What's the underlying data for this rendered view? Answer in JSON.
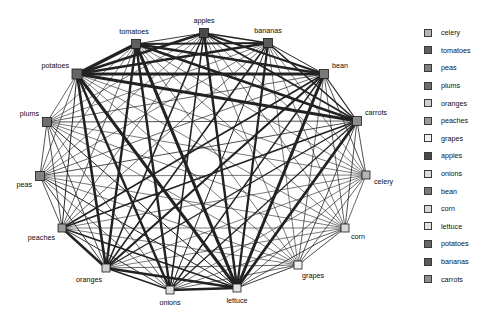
{
  "figure": {
    "type": "network-graph",
    "layout": "circular",
    "background_color": "#ffffff",
    "node_shape": "square",
    "node_outline_color": "#1a1a1a",
    "edge_color": "#222222",
    "label_color": "#0a0a0a"
  },
  "graph": {
    "nodes": [
      {
        "id": "apples",
        "label": "apples",
        "x": 204,
        "y": 33,
        "size": 9,
        "color": "#4a4a4a",
        "label_dx": 0,
        "label_dy": -10,
        "label_anchor": "middle"
      },
      {
        "id": "bananas",
        "label": "bananas",
        "x": 268,
        "y": 43,
        "size": 9,
        "color": "#5a5a5a",
        "label_dx": 0,
        "label_dy": -10,
        "label_anchor": "middle"
      },
      {
        "id": "bean",
        "label": "bean",
        "x": 324,
        "y": 74,
        "size": 9,
        "color": "#7a7a7a",
        "label_dx": 8,
        "label_dy": -6,
        "label_anchor": "start"
      },
      {
        "id": "carrots",
        "label": "carrots",
        "x": 357,
        "y": 121,
        "size": 9,
        "color": "#8d8d8d",
        "label_dx": 8,
        "label_dy": -6,
        "label_anchor": "start"
      },
      {
        "id": "celery",
        "label": "celery",
        "x": 366,
        "y": 175,
        "size": 8,
        "color": "#b5b5b5",
        "label_dx": 8,
        "label_dy": 9,
        "label_anchor": "start"
      },
      {
        "id": "corn",
        "label": "corn",
        "x": 345,
        "y": 228,
        "size": 8,
        "color": "#d8d8d8",
        "label_dx": 6,
        "label_dy": 11,
        "label_anchor": "start"
      },
      {
        "id": "grapes",
        "label": "grapes",
        "x": 298,
        "y": 265,
        "size": 8,
        "color": "#f0f0f0",
        "label_dx": 4,
        "label_dy": 13,
        "label_anchor": "start"
      },
      {
        "id": "lettuce",
        "label": "lettuce",
        "x": 237,
        "y": 288,
        "size": 8,
        "color": "#e2e2e2",
        "label_dx": 0,
        "label_dy": 15,
        "label_anchor": "middle"
      },
      {
        "id": "onions",
        "label": "onions",
        "x": 170,
        "y": 290,
        "size": 8,
        "color": "#dcdcdc",
        "label_dx": 0,
        "label_dy": 15,
        "label_anchor": "middle"
      },
      {
        "id": "oranges",
        "label": "oranges",
        "x": 106,
        "y": 268,
        "size": 8,
        "color": "#cfcfcf",
        "label_dx": -4,
        "label_dy": 14,
        "label_anchor": "end"
      },
      {
        "id": "peaches",
        "label": "peaches",
        "x": 62,
        "y": 228,
        "size": 8,
        "color": "#9a9a9a",
        "label_dx": -7,
        "label_dy": 12,
        "label_anchor": "end"
      },
      {
        "id": "peas",
        "label": "peas",
        "x": 40,
        "y": 176,
        "size": 9,
        "color": "#808080",
        "label_dx": -8,
        "label_dy": 11,
        "label_anchor": "end"
      },
      {
        "id": "plums",
        "label": "plums",
        "x": 47,
        "y": 122,
        "size": 9,
        "color": "#6e6e6e",
        "label_dx": -8,
        "label_dy": -6,
        "label_anchor": "end"
      },
      {
        "id": "potatoes",
        "label": "potatoes",
        "x": 77,
        "y": 74,
        "size": 10,
        "color": "#666666",
        "label_dx": -8,
        "label_dy": -6,
        "label_anchor": "end"
      },
      {
        "id": "tomatoes",
        "label": "tomatoes",
        "x": 136,
        "y": 44,
        "size": 9,
        "color": "#5f5f5f",
        "label_dx": -2,
        "label_dy": -10,
        "label_anchor": "middle"
      }
    ],
    "edges": [
      {
        "source": "potatoes",
        "target": "tomatoes",
        "weight": 3.2
      },
      {
        "source": "potatoes",
        "target": "apples",
        "weight": 2.6
      },
      {
        "source": "potatoes",
        "target": "bananas",
        "weight": 2.4
      },
      {
        "source": "potatoes",
        "target": "bean",
        "weight": 3.0
      },
      {
        "source": "potatoes",
        "target": "carrots",
        "weight": 2.8
      },
      {
        "source": "potatoes",
        "target": "lettuce",
        "weight": 3.0
      },
      {
        "source": "potatoes",
        "target": "onions",
        "weight": 2.4
      },
      {
        "source": "potatoes",
        "target": "oranges",
        "weight": 2.6
      },
      {
        "source": "potatoes",
        "target": "peaches",
        "weight": 1.0
      },
      {
        "source": "potatoes",
        "target": "peas",
        "weight": 0.7
      },
      {
        "source": "potatoes",
        "target": "plums",
        "weight": 0.7
      },
      {
        "source": "potatoes",
        "target": "celery",
        "weight": 0.6
      },
      {
        "source": "potatoes",
        "target": "corn",
        "weight": 0.6
      },
      {
        "source": "potatoes",
        "target": "grapes",
        "weight": 0.6
      },
      {
        "source": "tomatoes",
        "target": "apples",
        "weight": 0.9
      },
      {
        "source": "tomatoes",
        "target": "bananas",
        "weight": 2.2
      },
      {
        "source": "tomatoes",
        "target": "bean",
        "weight": 2.6
      },
      {
        "source": "tomatoes",
        "target": "carrots",
        "weight": 2.4
      },
      {
        "source": "tomatoes",
        "target": "lettuce",
        "weight": 3.2
      },
      {
        "source": "tomatoes",
        "target": "onions",
        "weight": 2.4
      },
      {
        "source": "tomatoes",
        "target": "oranges",
        "weight": 2.4
      },
      {
        "source": "tomatoes",
        "target": "peaches",
        "weight": 0.7
      },
      {
        "source": "tomatoes",
        "target": "peas",
        "weight": 0.6
      },
      {
        "source": "tomatoes",
        "target": "plums",
        "weight": 0.6
      },
      {
        "source": "tomatoes",
        "target": "celery",
        "weight": 0.6
      },
      {
        "source": "tomatoes",
        "target": "corn",
        "weight": 0.6
      },
      {
        "source": "tomatoes",
        "target": "grapes",
        "weight": 0.6
      },
      {
        "source": "apples",
        "target": "bananas",
        "weight": 1.4
      },
      {
        "source": "apples",
        "target": "bean",
        "weight": 2.2
      },
      {
        "source": "apples",
        "target": "carrots",
        "weight": 1.8
      },
      {
        "source": "apples",
        "target": "lettuce",
        "weight": 2.4
      },
      {
        "source": "apples",
        "target": "onions",
        "weight": 1.6
      },
      {
        "source": "apples",
        "target": "oranges",
        "weight": 1.6
      },
      {
        "source": "apples",
        "target": "peaches",
        "weight": 0.7
      },
      {
        "source": "apples",
        "target": "peas",
        "weight": 0.6
      },
      {
        "source": "apples",
        "target": "plums",
        "weight": 0.6
      },
      {
        "source": "apples",
        "target": "celery",
        "weight": 0.6
      },
      {
        "source": "apples",
        "target": "corn",
        "weight": 0.6
      },
      {
        "source": "apples",
        "target": "grapes",
        "weight": 0.6
      },
      {
        "source": "bananas",
        "target": "bean",
        "weight": 1.0
      },
      {
        "source": "bananas",
        "target": "carrots",
        "weight": 1.6
      },
      {
        "source": "bananas",
        "target": "lettuce",
        "weight": 2.2
      },
      {
        "source": "bananas",
        "target": "onions",
        "weight": 1.0
      },
      {
        "source": "bananas",
        "target": "oranges",
        "weight": 1.6
      },
      {
        "source": "bananas",
        "target": "peaches",
        "weight": 0.7
      },
      {
        "source": "bananas",
        "target": "peas",
        "weight": 0.6
      },
      {
        "source": "bananas",
        "target": "plums",
        "weight": 0.6
      },
      {
        "source": "bananas",
        "target": "celery",
        "weight": 0.6
      },
      {
        "source": "bananas",
        "target": "corn",
        "weight": 0.6
      },
      {
        "source": "bananas",
        "target": "grapes",
        "weight": 0.6
      },
      {
        "source": "bean",
        "target": "carrots",
        "weight": 1.2
      },
      {
        "source": "bean",
        "target": "lettuce",
        "weight": 3.0
      },
      {
        "source": "bean",
        "target": "onions",
        "weight": 1.4
      },
      {
        "source": "bean",
        "target": "oranges",
        "weight": 2.2
      },
      {
        "source": "bean",
        "target": "peaches",
        "weight": 1.6
      },
      {
        "source": "bean",
        "target": "peas",
        "weight": 0.7
      },
      {
        "source": "bean",
        "target": "plums",
        "weight": 0.7
      },
      {
        "source": "bean",
        "target": "celery",
        "weight": 0.8
      },
      {
        "source": "bean",
        "target": "corn",
        "weight": 0.7
      },
      {
        "source": "bean",
        "target": "grapes",
        "weight": 0.7
      },
      {
        "source": "carrots",
        "target": "lettuce",
        "weight": 2.8
      },
      {
        "source": "carrots",
        "target": "onions",
        "weight": 1.2
      },
      {
        "source": "carrots",
        "target": "oranges",
        "weight": 1.4
      },
      {
        "source": "carrots",
        "target": "peaches",
        "weight": 1.6
      },
      {
        "source": "carrots",
        "target": "peas",
        "weight": 0.8
      },
      {
        "source": "carrots",
        "target": "plums",
        "weight": 0.8
      },
      {
        "source": "carrots",
        "target": "celery",
        "weight": 0.8
      },
      {
        "source": "carrots",
        "target": "corn",
        "weight": 0.8
      },
      {
        "source": "carrots",
        "target": "grapes",
        "weight": 0.8
      },
      {
        "source": "celery",
        "target": "lettuce",
        "weight": 0.7
      },
      {
        "source": "celery",
        "target": "onions",
        "weight": 0.6
      },
      {
        "source": "celery",
        "target": "oranges",
        "weight": 0.6
      },
      {
        "source": "celery",
        "target": "peaches",
        "weight": 0.6
      },
      {
        "source": "celery",
        "target": "peas",
        "weight": 0.6
      },
      {
        "source": "celery",
        "target": "plums",
        "weight": 0.6
      },
      {
        "source": "celery",
        "target": "corn",
        "weight": 0.7
      },
      {
        "source": "celery",
        "target": "grapes",
        "weight": 0.7
      },
      {
        "source": "corn",
        "target": "lettuce",
        "weight": 0.8
      },
      {
        "source": "corn",
        "target": "onions",
        "weight": 0.7
      },
      {
        "source": "corn",
        "target": "oranges",
        "weight": 0.6
      },
      {
        "source": "corn",
        "target": "peaches",
        "weight": 0.6
      },
      {
        "source": "corn",
        "target": "peas",
        "weight": 0.6
      },
      {
        "source": "corn",
        "target": "plums",
        "weight": 0.6
      },
      {
        "source": "corn",
        "target": "grapes",
        "weight": 0.8
      },
      {
        "source": "grapes",
        "target": "lettuce",
        "weight": 0.9
      },
      {
        "source": "grapes",
        "target": "onions",
        "weight": 0.7
      },
      {
        "source": "grapes",
        "target": "oranges",
        "weight": 0.7
      },
      {
        "source": "grapes",
        "target": "peaches",
        "weight": 0.6
      },
      {
        "source": "grapes",
        "target": "peas",
        "weight": 0.6
      },
      {
        "source": "grapes",
        "target": "plums",
        "weight": 0.6
      },
      {
        "source": "lettuce",
        "target": "onions",
        "weight": 2.6
      },
      {
        "source": "lettuce",
        "target": "oranges",
        "weight": 2.6
      },
      {
        "source": "lettuce",
        "target": "peaches",
        "weight": 1.6
      },
      {
        "source": "lettuce",
        "target": "peas",
        "weight": 1.0
      },
      {
        "source": "lettuce",
        "target": "plums",
        "weight": 1.0
      },
      {
        "source": "onions",
        "target": "oranges",
        "weight": 1.4
      },
      {
        "source": "onions",
        "target": "peaches",
        "weight": 0.9
      },
      {
        "source": "onions",
        "target": "peas",
        "weight": 0.7
      },
      {
        "source": "onions",
        "target": "plums",
        "weight": 0.7
      },
      {
        "source": "oranges",
        "target": "peaches",
        "weight": 2.4
      },
      {
        "source": "oranges",
        "target": "peas",
        "weight": 0.9
      },
      {
        "source": "oranges",
        "target": "plums",
        "weight": 0.8
      },
      {
        "source": "peaches",
        "target": "peas",
        "weight": 0.8
      },
      {
        "source": "peaches",
        "target": "plums",
        "weight": 0.8
      },
      {
        "source": "peas",
        "target": "plums",
        "weight": 0.8
      }
    ]
  },
  "legend": {
    "items": [
      {
        "label": "celery",
        "color": "#b5b5b5"
      },
      {
        "label": "tomatoes",
        "color": "#5f5f5f"
      },
      {
        "label": "peas",
        "color": "#808080"
      },
      {
        "label": "plums",
        "color": "#6e6e6e"
      },
      {
        "label": "oranges",
        "color": "#cfcfcf"
      },
      {
        "label": "peaches",
        "color": "#9a9a9a"
      },
      {
        "label": "grapes",
        "color": "#f0f0f0"
      },
      {
        "label": "apples",
        "color": "#4a4a4a"
      },
      {
        "label": "onions",
        "color": "#dcdcdc"
      },
      {
        "label": "bean",
        "color": "#7a7a7a"
      },
      {
        "label": "corn",
        "color": "#d8d8d8"
      },
      {
        "label": "lettuce",
        "color": "#e2e2e2"
      },
      {
        "label": "potatoes",
        "color": "#666666"
      },
      {
        "label": "bananas",
        "color": "#5a5a5a"
      },
      {
        "label": "carrots",
        "color": "#8d8d8d"
      }
    ]
  }
}
